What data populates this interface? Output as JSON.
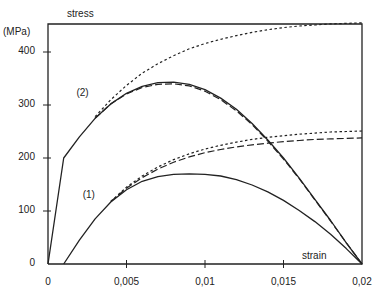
{
  "chart_data": {
    "type": "line",
    "title": "",
    "xlabel": "strain",
    "ylabel": "stress",
    "yunit": "(MPa)",
    "xlim": [
      0,
      0.02
    ],
    "ylim": [
      0,
      460
    ],
    "grid": false,
    "legend": "none (curves labeled inline)",
    "xticks": [
      0,
      0.005,
      0.01,
      0.015,
      0.02
    ],
    "xtick_labels": [
      "0",
      "0,005",
      "0,01",
      "0,015",
      "0,02"
    ],
    "yticks": [
      0,
      100,
      200,
      300,
      400
    ],
    "ytick_labels": [
      "0",
      "100",
      "200",
      "300",
      "400"
    ],
    "annotations": [
      {
        "text": "(1)",
        "x": 0.0031,
        "y": 118
      },
      {
        "text": "(2)",
        "x": 0.0027,
        "y": 312
      }
    ],
    "series": [
      {
        "name": "(2) solid",
        "style": "solid",
        "x": [
          0,
          0.001,
          0.002,
          0.003,
          0.004,
          0.005,
          0.006,
          0.007,
          0.008,
          0.009,
          0.01,
          0.011,
          0.012,
          0.013,
          0.014,
          0.015,
          0.016,
          0.017,
          0.018,
          0.019,
          0.02
        ],
        "y": [
          0,
          200,
          240,
          275,
          302,
          322,
          335,
          342,
          343,
          339,
          329,
          313,
          292,
          265,
          234,
          200,
          162,
          122,
          82,
          40,
          0
        ]
      },
      {
        "name": "(2) dashed",
        "style": "dashed",
        "x": [
          0.003,
          0.004,
          0.005,
          0.006,
          0.007,
          0.008,
          0.009,
          0.01,
          0.011,
          0.012,
          0.013,
          0.014,
          0.015,
          0.016,
          0.017,
          0.018,
          0.019,
          0.02
        ],
        "y": [
          275,
          302,
          321,
          333,
          339,
          340,
          336,
          326,
          310,
          289,
          263,
          232,
          198,
          161,
          121,
          81,
          40,
          0
        ]
      },
      {
        "name": "(2) dotted",
        "style": "dotted",
        "x": [
          0.003,
          0.004,
          0.005,
          0.006,
          0.007,
          0.008,
          0.009,
          0.01,
          0.011,
          0.012,
          0.013,
          0.014,
          0.015,
          0.016,
          0.017,
          0.018,
          0.019,
          0.02
        ],
        "y": [
          278,
          310,
          337,
          360,
          378,
          393,
          406,
          416,
          424,
          431,
          437,
          442,
          446,
          449,
          451,
          453,
          454,
          455
        ]
      },
      {
        "name": "(1) solid",
        "style": "solid",
        "x": [
          0.001,
          0.002,
          0.003,
          0.004,
          0.005,
          0.006,
          0.007,
          0.008,
          0.009,
          0.01,
          0.011,
          0.012,
          0.013,
          0.014,
          0.015,
          0.016,
          0.017,
          0.018,
          0.019,
          0.02
        ],
        "y": [
          0,
          45,
          85,
          117,
          140,
          156,
          165,
          169,
          170,
          169,
          166,
          159,
          149,
          136,
          120,
          101,
          80,
          56,
          29,
          0
        ]
      },
      {
        "name": "(1) dashed",
        "style": "dashed",
        "x": [
          0.004,
          0.005,
          0.006,
          0.007,
          0.008,
          0.009,
          0.01,
          0.011,
          0.012,
          0.013,
          0.014,
          0.015,
          0.016,
          0.017,
          0.018,
          0.019,
          0.02
        ],
        "y": [
          118,
          143,
          163,
          179,
          192,
          202,
          210,
          216,
          221,
          225,
          228,
          231,
          233,
          235,
          236,
          237,
          238
        ]
      },
      {
        "name": "(1) dotted",
        "style": "dotted",
        "x": [
          0.004,
          0.005,
          0.006,
          0.007,
          0.008,
          0.009,
          0.01,
          0.011,
          0.012,
          0.013,
          0.014,
          0.015,
          0.016,
          0.017,
          0.018,
          0.019,
          0.02
        ],
        "y": [
          118,
          145,
          166,
          183,
          197,
          208,
          217,
          224,
          230,
          235,
          239,
          242,
          245,
          247,
          249,
          250,
          251
        ]
      },
      {
        "name": "(2) unloading from 0.02",
        "style": "solid",
        "x": [
          0.02
        ],
        "y": [
          0
        ]
      }
    ]
  }
}
